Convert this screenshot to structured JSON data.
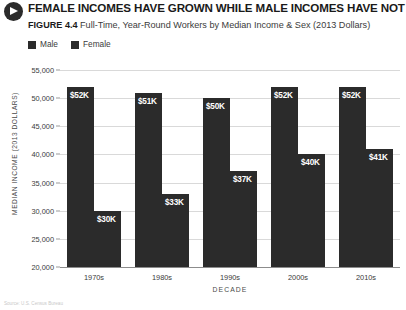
{
  "header": {
    "icon": "arrow-right-circle-icon",
    "title": "FEMALE INCOMES HAVE GROWN WHILE MALE INCOMES HAVE NOT",
    "figure_number": "FIGURE 4.4",
    "subtitle": "Full-Time, Year-Round Workers by Median Income & Sex (2013 Dollars)"
  },
  "source_note": "Source: U.S. Census Bureau",
  "chart_data": {
    "type": "bar",
    "title": "FEMALE INCOMES HAVE GROWN WHILE MALE INCOMES HAVE NOT",
    "subtitle": "Full-Time, Year-Round Workers by Median Income & Sex (2013 Dollars)",
    "xlabel": "DECADE",
    "ylabel": "MEDIAN INCOME (2013 DOLLARS)",
    "ylim": [
      20000,
      55000
    ],
    "ytick_step": 5000,
    "yticks": [
      55000,
      50000,
      45000,
      40000,
      35000,
      30000,
      25000,
      20000
    ],
    "ytick_labels": [
      "55,000",
      "50,000",
      "45,000",
      "40,000",
      "35,000",
      "30,000",
      "25,000",
      "20,000"
    ],
    "grid": true,
    "legend_position": "top-left",
    "categories": [
      "1970s",
      "1980s",
      "1990s",
      "2000s",
      "2010s"
    ],
    "series": [
      {
        "name": "Male",
        "color": "#2b2b2b",
        "values": [
          52000,
          51000,
          50000,
          52000,
          52000
        ],
        "labels": [
          "$52K",
          "$51K",
          "$50K",
          "$52K",
          "$52K"
        ]
      },
      {
        "name": "Female",
        "color": "#2b2b2b",
        "values": [
          30000,
          33000,
          37000,
          40000,
          41000
        ],
        "labels": [
          "$30K",
          "$33K",
          "$37K",
          "$40K",
          "$41K"
        ]
      }
    ]
  }
}
